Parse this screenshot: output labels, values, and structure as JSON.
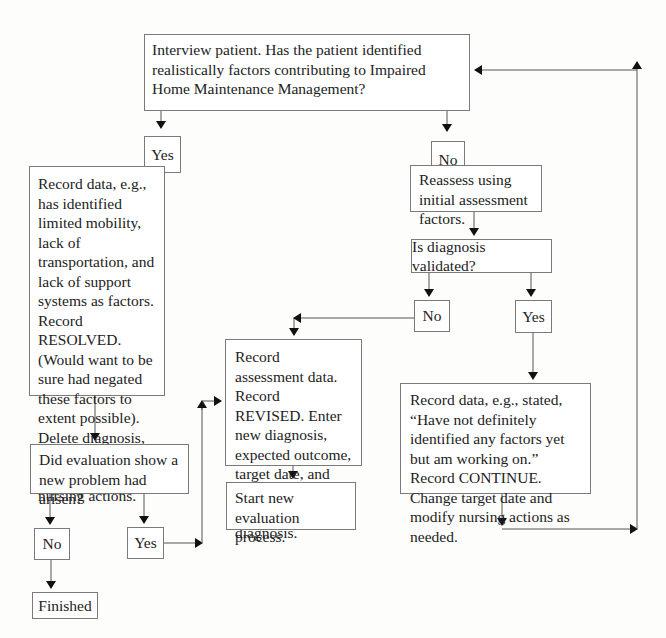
{
  "diagram": {
    "type": "flowchart",
    "nodes": {
      "interview": {
        "text": "Interview patient. Has the patient identified realistically factors contributing to Impaired Home Maintenance Management?"
      },
      "yes_top": {
        "text": "Yes"
      },
      "no_top": {
        "text": "No"
      },
      "record_resolved": {
        "text": "Record data, e.g., has identified limited mobility, lack of transportation, and lack of support systems as factors. Record RESOLVED. (Would want to be sure had negated these factors to extent possible). Delete diagnosis, expected outcome, target date, and nursing actions."
      },
      "reassess": {
        "text": "Reassess using initial assessment factors."
      },
      "is_validated": {
        "text": "Is diagnosis validated?"
      },
      "no_mid": {
        "text": "No"
      },
      "yes_mid": {
        "text": "Yes"
      },
      "record_revised": {
        "text": "Record assessment data. Record REVISED. Enter new diagnosis, expected outcome, target date, and nursing actions. Delete old diagnosis."
      },
      "start_new": {
        "text": "Start new evaluation process."
      },
      "record_continue": {
        "text": "Record data, e.g., stated, “Have not definitely identified any factors yet but am working on.” Record CONTINUE. Change target date and modify nursing actions as needed."
      },
      "did_evaluation": {
        "text": "Did evaluation show a new problem had arisen?"
      },
      "no_bottom": {
        "text": "No"
      },
      "yes_bottom": {
        "text": "Yes"
      },
      "finished": {
        "text": "Finished"
      }
    },
    "edges": [
      [
        "interview",
        "yes_top"
      ],
      [
        "interview",
        "no_top"
      ],
      [
        "yes_top",
        "record_resolved"
      ],
      [
        "no_top",
        "reassess"
      ],
      [
        "reassess",
        "is_validated"
      ],
      [
        "is_validated",
        "no_mid"
      ],
      [
        "is_validated",
        "yes_mid"
      ],
      [
        "no_mid",
        "record_revised"
      ],
      [
        "yes_mid",
        "record_continue"
      ],
      [
        "record_revised",
        "start_new"
      ],
      [
        "record_resolved",
        "did_evaluation"
      ],
      [
        "did_evaluation",
        "no_bottom"
      ],
      [
        "did_evaluation",
        "yes_bottom"
      ],
      [
        "no_bottom",
        "finished"
      ],
      [
        "yes_bottom",
        "record_revised"
      ],
      [
        "record_continue",
        "interview"
      ]
    ],
    "colors": {
      "line": "#555555",
      "border": "#7a7a7a",
      "text": "#222222"
    }
  }
}
